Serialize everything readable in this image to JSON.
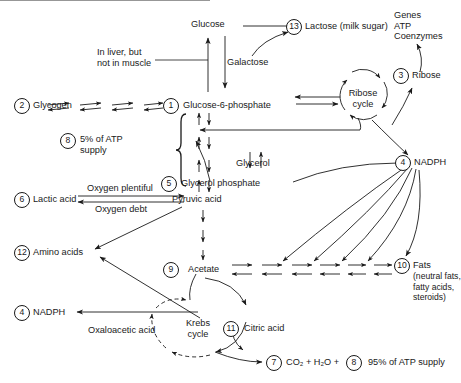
{
  "diagram": {
    "nodes": {
      "glucose": "Glucose",
      "g6p": "Glucose-6-phosphate",
      "glycogen": "Glycogen",
      "galactose": "Galactose",
      "lactose": "Lactose (milk sugar)",
      "genes": "Genes\nATP\nCoenzymes",
      "ribose": "Ribose",
      "ribose_cycle": "Ribose\ncycle",
      "nadph_right": "NADPH",
      "glycerol": "Glycerol",
      "glycerol_phosphate": "Glycerol phosphate",
      "pyruvic": "Pyruvic acid",
      "lactic": "Lactic acid",
      "amino": "Amino acids",
      "acetate": "Acetate",
      "fats": "Fats",
      "fats_sub": "(neutral fats,\nfatty acids,\nsteroids)",
      "nadph_left": "NADPH",
      "oxaloacetic": "Oxaloacetic acid",
      "krebs_cycle": "Krebs\ncycle",
      "citric": "Citric acid",
      "co2": "CO₂ + H₂O +",
      "atp95": "95% of ATP supply",
      "atp5": "5% of ATP\nsupply"
    },
    "annotations": {
      "liver": "In liver, but\nnot in muscle",
      "oxygen_plentiful": "Oxygen plentiful",
      "oxygen_debt": "Oxygen debt"
    },
    "markers": {
      "m1": "1",
      "m2": "2",
      "m3": "3",
      "m4a": "4",
      "m4b": "4",
      "m5": "5",
      "m6": "6",
      "m7": "7",
      "m8a": "8",
      "m8b": "8",
      "m9": "9",
      "m10": "10",
      "m11": "11",
      "m12": "12",
      "m13": "13"
    },
    "colors": {
      "stroke": "#1a1a1a",
      "background": "#ffffff"
    }
  }
}
